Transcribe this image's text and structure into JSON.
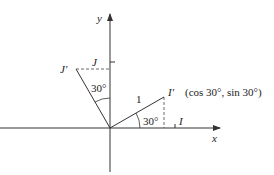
{
  "diagram": {
    "axes": {
      "x_label": "x",
      "y_label": "y"
    },
    "points": {
      "I_label": "I",
      "J_label": "J",
      "I_prime_label": "I′",
      "J_prime_label": "J′",
      "I_prime_coords": "(cos 30°, sin 30°)"
    },
    "angles": {
      "angle_I": "30°",
      "angle_J": "30°"
    },
    "length_label": "1",
    "colors": {
      "line": "#333333",
      "text": "#222222",
      "background": "#ffffff"
    }
  }
}
